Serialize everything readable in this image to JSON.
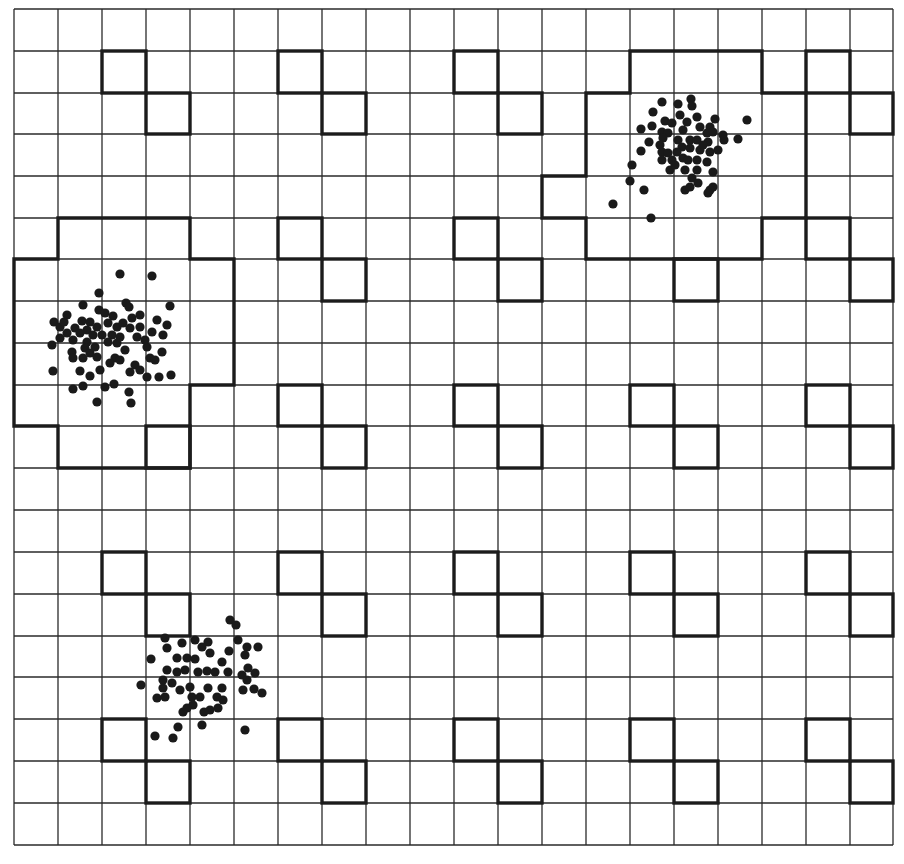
{
  "diagram": {
    "colors": {
      "background": "#ffffff",
      "grid": "#2a2a2a",
      "outline": "#1c1c1c",
      "dot": "#1a1a1a"
    },
    "grid": {
      "cols": 20,
      "rows": 20,
      "x_lines": [
        14,
        58,
        102,
        146,
        190,
        234,
        278,
        322,
        366,
        410,
        454,
        498,
        542,
        586,
        630,
        674,
        718,
        762,
        806,
        850,
        893
      ],
      "y_lines": [
        9,
        51,
        93,
        134,
        176,
        218,
        259,
        301,
        343,
        385,
        426,
        468,
        510,
        552,
        594,
        636,
        677,
        719,
        761,
        803,
        845
      ]
    },
    "motif": {
      "pattern": "diagonal pair of cells (c,r) and (c+1,r+1)",
      "origin_cols": [
        2,
        6,
        10,
        14,
        18
      ],
      "origin_rows": [
        1,
        5,
        9,
        13,
        17
      ]
    },
    "regions": [
      {
        "name": "left-region",
        "cells": [
          [
            1,
            5
          ],
          [
            2,
            5
          ],
          [
            3,
            5
          ],
          [
            0,
            6
          ],
          [
            1,
            6
          ],
          [
            2,
            6
          ],
          [
            3,
            6
          ],
          [
            4,
            6
          ],
          [
            0,
            7
          ],
          [
            1,
            7
          ],
          [
            2,
            7
          ],
          [
            3,
            7
          ],
          [
            4,
            7
          ],
          [
            0,
            8
          ],
          [
            1,
            8
          ],
          [
            2,
            8
          ],
          [
            3,
            8
          ],
          [
            4,
            8
          ],
          [
            0,
            9
          ],
          [
            1,
            9
          ],
          [
            2,
            9
          ],
          [
            3,
            9
          ],
          [
            1,
            10
          ],
          [
            2,
            10
          ],
          [
            3,
            10
          ]
        ],
        "keep_motif_cells": [
          [
            3,
            10
          ]
        ]
      },
      {
        "name": "top-right-region",
        "cells": [
          [
            14,
            1
          ],
          [
            15,
            1
          ],
          [
            16,
            1
          ],
          [
            13,
            2
          ],
          [
            14,
            2
          ],
          [
            15,
            2
          ],
          [
            16,
            2
          ],
          [
            17,
            2
          ],
          [
            13,
            3
          ],
          [
            14,
            3
          ],
          [
            15,
            3
          ],
          [
            16,
            3
          ],
          [
            17,
            3
          ],
          [
            12,
            4
          ],
          [
            13,
            4
          ],
          [
            14,
            4
          ],
          [
            15,
            4
          ],
          [
            16,
            4
          ],
          [
            17,
            4
          ],
          [
            13,
            5
          ],
          [
            14,
            5
          ],
          [
            15,
            5
          ],
          [
            16,
            5
          ]
        ],
        "keep_motif_cells": []
      }
    ],
    "clusters": [
      {
        "name": "left-cluster",
        "points": [
          [
            120,
            274
          ],
          [
            152,
            276
          ],
          [
            99,
            293
          ],
          [
            83,
            305
          ],
          [
            126,
            303
          ],
          [
            129,
            307
          ],
          [
            170,
            306
          ],
          [
            67,
            315
          ],
          [
            99,
            310
          ],
          [
            105,
            313
          ],
          [
            113,
            316
          ],
          [
            140,
            315
          ],
          [
            54,
            322
          ],
          [
            60,
            327
          ],
          [
            82,
            321
          ],
          [
            90,
            322
          ],
          [
            75,
            328
          ],
          [
            87,
            330
          ],
          [
            97,
            327
          ],
          [
            108,
            323
          ],
          [
            117,
            327
          ],
          [
            123,
            323
          ],
          [
            130,
            328
          ],
          [
            140,
            327
          ],
          [
            157,
            320
          ],
          [
            167,
            325
          ],
          [
            152,
            332
          ],
          [
            67,
            333
          ],
          [
            80,
            333
          ],
          [
            93,
            335
          ],
          [
            112,
            335
          ],
          [
            120,
            337
          ],
          [
            137,
            337
          ],
          [
            163,
            335
          ],
          [
            73,
            340
          ],
          [
            87,
            342
          ],
          [
            108,
            342
          ],
          [
            117,
            343
          ],
          [
            52,
            345
          ],
          [
            85,
            348
          ],
          [
            95,
            347
          ],
          [
            125,
            350
          ],
          [
            147,
            347
          ],
          [
            72,
            352
          ],
          [
            90,
            353
          ],
          [
            97,
            357
          ],
          [
            83,
            358
          ],
          [
            115,
            358
          ],
          [
            110,
            363
          ],
          [
            150,
            358
          ],
          [
            162,
            352
          ],
          [
            73,
            358
          ],
          [
            53,
            371
          ],
          [
            80,
            371
          ],
          [
            90,
            376
          ],
          [
            130,
            372
          ],
          [
            135,
            365
          ],
          [
            140,
            370
          ],
          [
            147,
            377
          ],
          [
            159,
            377
          ],
          [
            171,
            375
          ],
          [
            73,
            389
          ],
          [
            83,
            386
          ],
          [
            105,
            387
          ],
          [
            114,
            384
          ],
          [
            129,
            392
          ],
          [
            131,
            403
          ],
          [
            97,
            402
          ],
          [
            64,
            322
          ],
          [
            102,
            335
          ],
          [
            132,
            318
          ],
          [
            145,
            340
          ],
          [
            60,
            338
          ],
          [
            155,
            360
          ],
          [
            100,
            370
          ],
          [
            120,
            360
          ]
        ]
      },
      {
        "name": "top-right-cluster",
        "points": [
          [
            662,
            102
          ],
          [
            678,
            104
          ],
          [
            691,
            99
          ],
          [
            692,
            106
          ],
          [
            653,
            112
          ],
          [
            680,
            115
          ],
          [
            697,
            117
          ],
          [
            715,
            119
          ],
          [
            747,
            120
          ],
          [
            665,
            121
          ],
          [
            641,
            129
          ],
          [
            652,
            126
          ],
          [
            672,
            123
          ],
          [
            683,
            130
          ],
          [
            700,
            127
          ],
          [
            710,
            127
          ],
          [
            662,
            132
          ],
          [
            668,
            133
          ],
          [
            707,
            133
          ],
          [
            713,
            132
          ],
          [
            723,
            135
          ],
          [
            724,
            140
          ],
          [
            738,
            139
          ],
          [
            649,
            142
          ],
          [
            663,
            138
          ],
          [
            678,
            140
          ],
          [
            690,
            140
          ],
          [
            697,
            140
          ],
          [
            708,
            142
          ],
          [
            682,
            147
          ],
          [
            690,
            148
          ],
          [
            641,
            151
          ],
          [
            662,
            152
          ],
          [
            668,
            153
          ],
          [
            677,
            152
          ],
          [
            700,
            150
          ],
          [
            710,
            152
          ],
          [
            662,
            160
          ],
          [
            672,
            160
          ],
          [
            683,
            158
          ],
          [
            697,
            160
          ],
          [
            707,
            162
          ],
          [
            632,
            165
          ],
          [
            670,
            170
          ],
          [
            685,
            170
          ],
          [
            697,
            170
          ],
          [
            713,
            172
          ],
          [
            692,
            178
          ],
          [
            630,
            181
          ],
          [
            698,
            183
          ],
          [
            644,
            190
          ],
          [
            685,
            190
          ],
          [
            690,
            187
          ],
          [
            710,
            190
          ],
          [
            713,
            187
          ],
          [
            708,
            193
          ],
          [
            613,
            204
          ],
          [
            651,
            218
          ],
          [
            687,
            122
          ],
          [
            703,
            145
          ],
          [
            675,
            165
          ],
          [
            688,
            160
          ],
          [
            660,
            145
          ],
          [
            718,
            150
          ]
        ]
      },
      {
        "name": "bottom-left-cluster",
        "points": [
          [
            230,
            620
          ],
          [
            236,
            625
          ],
          [
            165,
            638
          ],
          [
            182,
            643
          ],
          [
            195,
            640
          ],
          [
            208,
            642
          ],
          [
            167,
            648
          ],
          [
            202,
            647
          ],
          [
            210,
            653
          ],
          [
            229,
            651
          ],
          [
            238,
            640
          ],
          [
            247,
            647
          ],
          [
            258,
            647
          ],
          [
            245,
            655
          ],
          [
            151,
            659
          ],
          [
            177,
            658
          ],
          [
            187,
            658
          ],
          [
            195,
            659
          ],
          [
            222,
            662
          ],
          [
            167,
            670
          ],
          [
            177,
            672
          ],
          [
            185,
            670
          ],
          [
            198,
            672
          ],
          [
            207,
            671
          ],
          [
            215,
            672
          ],
          [
            228,
            672
          ],
          [
            242,
            675
          ],
          [
            248,
            668
          ],
          [
            255,
            673
          ],
          [
            247,
            680
          ],
          [
            141,
            685
          ],
          [
            163,
            680
          ],
          [
            172,
            683
          ],
          [
            163,
            688
          ],
          [
            180,
            690
          ],
          [
            190,
            687
          ],
          [
            208,
            688
          ],
          [
            222,
            688
          ],
          [
            243,
            690
          ],
          [
            254,
            689
          ],
          [
            262,
            693
          ],
          [
            157,
            698
          ],
          [
            165,
            697
          ],
          [
            192,
            697
          ],
          [
            200,
            697
          ],
          [
            217,
            697
          ],
          [
            223,
            700
          ],
          [
            193,
            705
          ],
          [
            210,
            710
          ],
          [
            218,
            708
          ],
          [
            204,
            712
          ],
          [
            183,
            712
          ],
          [
            187,
            708
          ],
          [
            202,
            725
          ],
          [
            178,
            727
          ],
          [
            245,
            730
          ],
          [
            155,
            736
          ],
          [
            173,
            738
          ]
        ]
      }
    ],
    "dot_radius": 4.6
  }
}
